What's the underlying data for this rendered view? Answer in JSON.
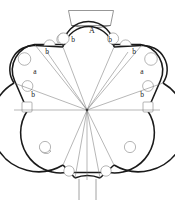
{
  "figure": {
    "type": "architectural-floor-plan",
    "canvas": {
      "width": 175,
      "height": 203,
      "background": "#ffffff"
    },
    "center": {
      "x": 87,
      "y": 110
    },
    "colors": {
      "outline_dark": "#1a1a1a",
      "outline_mid": "#4a4a4a",
      "radial_line": "#6e6e6e",
      "niche_line": "#8a8a8a",
      "label": "#1a1a1a",
      "background": "#ffffff"
    },
    "stroke_widths": {
      "outer_wall": 1.6,
      "lobe_arc": 1.2,
      "radial": 0.55,
      "niche": 0.6,
      "porch": 0.7
    }
  },
  "labels": [
    {
      "id": "A",
      "text": "A",
      "x": 92,
      "y": 31,
      "class": "lbl lbl-A",
      "note": "apex angle at top lobe"
    },
    {
      "id": "b1",
      "text": "b",
      "x": 73,
      "y": 40,
      "class": "lbl",
      "note": "left of top lobe"
    },
    {
      "id": "b2",
      "text": "b",
      "x": 110,
      "y": 40,
      "class": "lbl",
      "note": "right of top lobe"
    },
    {
      "id": "b3",
      "text": "b",
      "x": 47,
      "y": 52,
      "class": "lbl",
      "note": "upper-left straight bay"
    },
    {
      "id": "b4",
      "text": "b",
      "x": 134,
      "y": 52,
      "class": "lbl",
      "note": "upper-right straight bay"
    },
    {
      "id": "a1",
      "text": "a",
      "x": 35,
      "y": 72,
      "class": "lbl",
      "note": "left lobe angle"
    },
    {
      "id": "a2",
      "text": "a",
      "x": 142,
      "y": 72,
      "class": "lbl",
      "note": "right lobe angle"
    },
    {
      "id": "b5",
      "text": "b",
      "x": 33,
      "y": 95,
      "class": "lbl",
      "note": "lower-left straight bay"
    },
    {
      "id": "b6",
      "text": "b",
      "x": 142,
      "y": 95,
      "class": "lbl",
      "note": "lower-right straight bay"
    }
  ],
  "elements": {
    "top_porch": "rectangular-trapezoid porch above the north lobe",
    "bottom_entrance": "narrow entrance passage with two parallel jambs at the south",
    "lobes": 5,
    "niches": 14,
    "radial_lines": 12
  }
}
